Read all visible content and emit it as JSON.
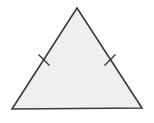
{
  "diagram": {
    "shape": "isosceles-triangle",
    "fill_color": "#efefef",
    "stroke_color": "#3a3a3a",
    "vertices": {
      "apex": [
        77,
        8
      ],
      "bottom_left": [
        12,
        109
      ],
      "bottom_right": [
        142,
        108
      ]
    },
    "congruence_marks": [
      {
        "side": "left",
        "center": [
          44,
          60
        ],
        "count": 1
      },
      {
        "side": "right",
        "center": [
          110,
          60
        ],
        "count": 1
      }
    ]
  }
}
